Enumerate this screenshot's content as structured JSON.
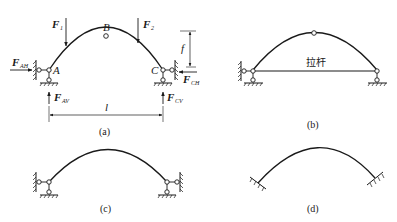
{
  "figure": {
    "panels": [
      {
        "id": "a",
        "caption": "(a)",
        "type": "three-hinged-arch",
        "hinges": {
          "left": "A",
          "crown": "B",
          "right": "C"
        },
        "loads": [
          {
            "name": "F",
            "sub": "1"
          },
          {
            "name": "F",
            "sub": "2"
          }
        ],
        "reactions": [
          {
            "name": "F",
            "sub": "AH"
          },
          {
            "name": "F",
            "sub": "AV"
          },
          {
            "name": "F",
            "sub": "CH"
          },
          {
            "name": "F",
            "sub": "CV"
          }
        ],
        "dimensions": {
          "span": "l",
          "rise": "f"
        }
      },
      {
        "id": "b",
        "caption": "(b)",
        "type": "tied-arch",
        "tie_label": "拉杆"
      },
      {
        "id": "c",
        "caption": "(c)",
        "type": "two-hinged-arch"
      },
      {
        "id": "d",
        "caption": "(d)",
        "type": "fixed-arch"
      }
    ]
  }
}
